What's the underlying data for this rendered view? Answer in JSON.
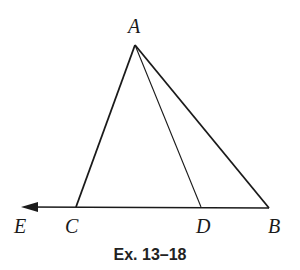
{
  "diagram": {
    "type": "geometry",
    "caption": "Ex. 13–18",
    "points": {
      "A": {
        "label": "A",
        "x": 135,
        "y": 45
      },
      "B": {
        "label": "B",
        "x": 269,
        "y": 208
      },
      "C": {
        "label": "C",
        "x": 76,
        "y": 207
      },
      "D": {
        "label": "D",
        "x": 201,
        "y": 207
      },
      "E": {
        "label": "E",
        "x": 21,
        "y": 207
      }
    },
    "segments": [
      "AB",
      "AC",
      "AD",
      "CB"
    ],
    "rays": [
      "CE"
    ],
    "colors": {
      "stroke": "#1a1a1a",
      "background": "#ffffff"
    }
  }
}
